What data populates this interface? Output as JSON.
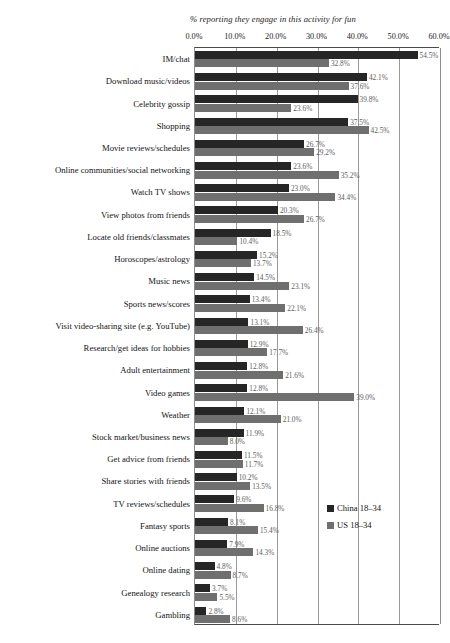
{
  "chart_data": {
    "type": "bar",
    "orientation": "horizontal",
    "title": "% reporting they engage in this activity for fun",
    "xlabel": "",
    "ylabel": "",
    "xlim": [
      0,
      60
    ],
    "grid": true,
    "legend_position": "right",
    "tick_labels": [
      "0.0%",
      "10.0%",
      "20.0%",
      "30.0%",
      "40.0%",
      "50.0%",
      "60.0%"
    ],
    "tick_values": [
      0,
      10,
      20,
      30,
      40,
      50,
      60
    ],
    "categories": [
      "IM/chat",
      "Download music/videos",
      "Celebrity gossip",
      "Shopping",
      "Movie reviews/schedules",
      "Online communities/social networking",
      "Watch TV shows",
      "View photos from friends",
      "Locate old friends/classmates",
      "Horoscopes/astrology",
      "Music news",
      "Sports news/scores",
      "Visit video-sharing site (e.g. YouTube)",
      "Research/get ideas for hobbies",
      "Adult entertainment",
      "Video games",
      "Weather",
      "Stock market/business news",
      "Get advice from friends",
      "Share stories with friends",
      "TV reviews/schedules",
      "Fantasy sports",
      "Online auctions",
      "Online dating",
      "Genealogy research",
      "Gambling"
    ],
    "series": [
      {
        "name": "China 18–34",
        "color": "#262626",
        "values": [
          54.5,
          42.1,
          39.8,
          37.5,
          26.7,
          23.6,
          23.0,
          20.3,
          18.5,
          15.2,
          14.5,
          13.4,
          13.1,
          12.9,
          12.8,
          12.8,
          12.1,
          11.9,
          11.5,
          10.2,
          9.6,
          8.1,
          7.9,
          4.8,
          3.7,
          2.8
        ],
        "labels": [
          "54.5%",
          "42.1%",
          "39.8%",
          "37.5%",
          "26.7%",
          "23.6%",
          "23.0%",
          "20.3%",
          "18.5%",
          "15.2%",
          "14.5%",
          "13.4%",
          "13.1%",
          "12.9%",
          "12.8%",
          "12.8%",
          "12.1%",
          "11.9%",
          "11.5%",
          "10.2%",
          "9.6%",
          "8.1%",
          "7.9%",
          "4.8%",
          "3.7%",
          "2.8%"
        ]
      },
      {
        "name": "US 18–34",
        "color": "#6f6f6f",
        "values": [
          32.8,
          37.6,
          23.6,
          42.5,
          29.2,
          35.2,
          34.4,
          26.7,
          10.4,
          13.7,
          23.1,
          22.1,
          26.4,
          17.7,
          21.6,
          39.0,
          21.0,
          8.0,
          11.7,
          13.5,
          16.8,
          15.4,
          14.3,
          8.7,
          5.5,
          8.6
        ],
        "labels": [
          "32.8%",
          "37.6%",
          "23.6%",
          "42.5%",
          "29.2%",
          "35.2%",
          "34.4%",
          "26.7%",
          "10.4%",
          "13.7%",
          "23.1%",
          "22.1%",
          "26.4%",
          "17.7%",
          "21.6%",
          "39.0%",
          "21.0%",
          "8.0%",
          "11.7%",
          "13.5%",
          "16.8%",
          "15.4%",
          "14.3%",
          "8.7%",
          "5.5%",
          "8.6%"
        ]
      }
    ]
  }
}
